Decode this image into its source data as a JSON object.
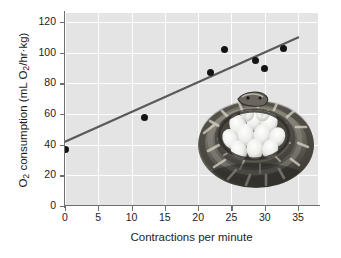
{
  "figure": {
    "background_color": "#ffffff",
    "plot_background_color": "#e4e4e4",
    "gridline_color": "#fdfdfd",
    "axis_color": "#6f6f6f",
    "marker_color": "#141414",
    "trendline_color": "#5a5a5a"
  },
  "axis_titles": {
    "x": "Contractions per minute",
    "y_prefix": "O",
    "y_sub1": "2",
    "y_mid": " consumption (mL O",
    "y_sub2": "2",
    "y_suffix": "/hr·kg)"
  },
  "ticks": {
    "x": [
      "0",
      "5",
      "10",
      "15",
      "20",
      "25",
      "30",
      "35"
    ],
    "y": [
      "0",
      "20",
      "40",
      "60",
      "80",
      "100",
      "120"
    ]
  },
  "inset": {
    "caption": "python coiled around egg clutch",
    "alt": "Photograph of a brooding python coiled around a clutch of white eggs"
  },
  "chart_data": {
    "type": "scatter",
    "title": "",
    "xlabel": "Contractions per minute",
    "ylabel": "O2 consumption (mL O2/hr·kg)",
    "xlim": [
      0,
      38
    ],
    "ylim": [
      0,
      126
    ],
    "xticks": [
      0,
      5,
      10,
      15,
      20,
      25,
      30,
      35
    ],
    "yticks": [
      0,
      20,
      40,
      60,
      80,
      100,
      120
    ],
    "grid": true,
    "legend": null,
    "points": [
      {
        "x": 0.0,
        "y": 37
      },
      {
        "x": 12.0,
        "y": 58
      },
      {
        "x": 21.8,
        "y": 87
      },
      {
        "x": 23.9,
        "y": 102
      },
      {
        "x": 28.6,
        "y": 95
      },
      {
        "x": 29.9,
        "y": 90
      },
      {
        "x": 32.8,
        "y": 103
      }
    ],
    "trendline": {
      "type": "linear",
      "x_start": 0.0,
      "y_start": 42,
      "x_end": 35.0,
      "y_end": 110
    }
  }
}
